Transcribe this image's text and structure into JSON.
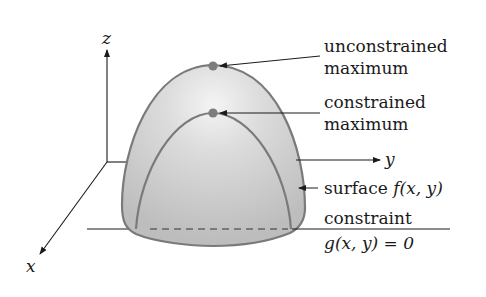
{
  "figure": {
    "axes": {
      "x_label": "x",
      "y_label": "y",
      "z_label": "z"
    },
    "annotations": {
      "unconstrained_line1": "unconstrained",
      "unconstrained_line2": "maximum",
      "constrained_line1": "constrained",
      "constrained_line2": "maximum",
      "surface_prefix": "surface ",
      "surface_func": "f(x, y)",
      "constraint_line1": "constraint",
      "constraint_line2": "g(x, y) = 0"
    },
    "colors": {
      "dome_fill": "#c9c9c9",
      "dome_highlight": "#f2f2f2",
      "dome_edge": "#7a7a7a",
      "max_point": "#7d7d7d",
      "axis": "#1a1a1a"
    }
  }
}
